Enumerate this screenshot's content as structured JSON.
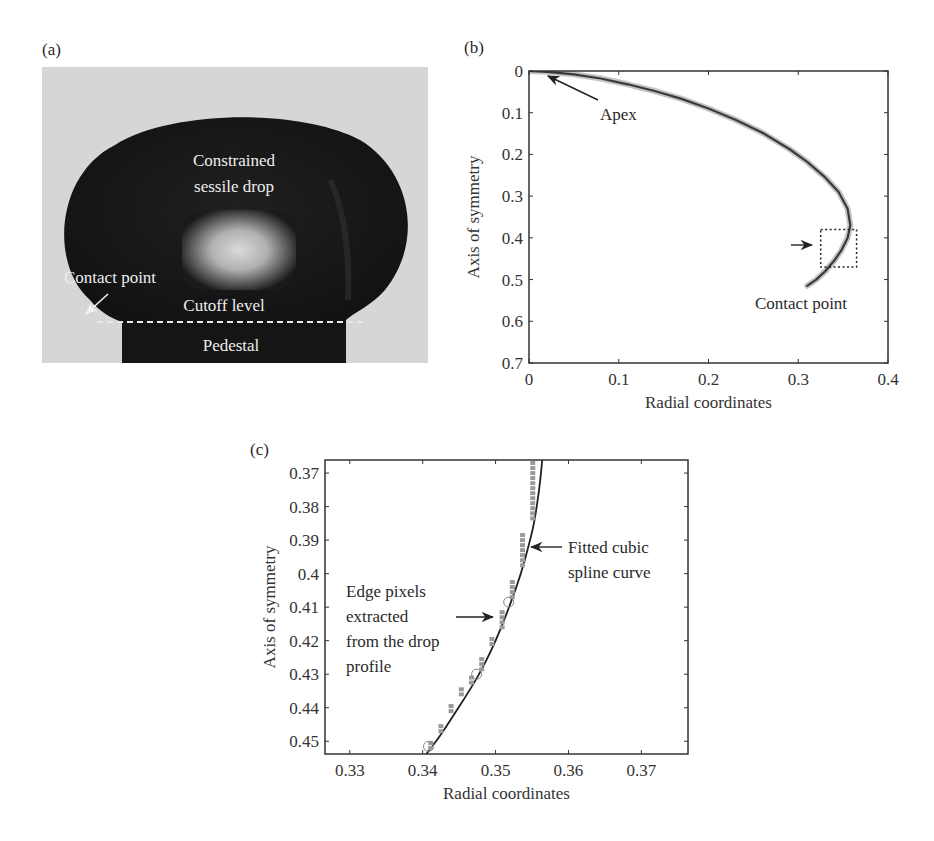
{
  "panels": {
    "a": {
      "label": "(a)",
      "labels": {
        "drop_line1": "Constrained",
        "drop_line2": "sessile drop",
        "contact_point": "Contact point",
        "cutoff_level": "Cutoff level",
        "pedestal": "Pedestal"
      }
    },
    "b": {
      "label": "(b)",
      "annotations": {
        "apex": "Apex",
        "contact_point": "Contact point"
      }
    },
    "c": {
      "label": "(c)",
      "annotations": {
        "spline_line1": "Fitted cubic",
        "spline_line2": "spline curve",
        "edge_line1": "Edge pixels",
        "edge_line2": "extracted",
        "edge_line3": "from the drop",
        "edge_line4": "profile"
      }
    }
  },
  "chart_data": [
    {
      "id": "b",
      "type": "line",
      "title": "",
      "xlabel": "Radial coordinates",
      "ylabel": "Axis of symmetry",
      "xlim": [
        0,
        0.4
      ],
      "ylim": [
        0,
        0.7
      ],
      "y_inverted": true,
      "xticks": [
        "0",
        "0.1",
        "0.2",
        "0.3",
        "0.4"
      ],
      "xtick_values": [
        0,
        0.1,
        0.2,
        0.3,
        0.4
      ],
      "yticks": [
        "0",
        "0.1",
        "0.2",
        "0.3",
        "0.4",
        "0.5",
        "0.6",
        "0.7"
      ],
      "ytick_values": [
        0,
        0.1,
        0.2,
        0.3,
        0.4,
        0.5,
        0.6,
        0.7
      ],
      "grid": false,
      "series": [
        {
          "name": "Drop profile (edge pixels + fitted spline)",
          "x": [
            0,
            0.02,
            0.05,
            0.08,
            0.11,
            0.14,
            0.17,
            0.2,
            0.23,
            0.26,
            0.29,
            0.31,
            0.33,
            0.345,
            0.355,
            0.358,
            0.355,
            0.348,
            0.34,
            0.33,
            0.32,
            0.31
          ],
          "y": [
            0,
            0.002,
            0.008,
            0.018,
            0.032,
            0.048,
            0.067,
            0.09,
            0.117,
            0.148,
            0.187,
            0.218,
            0.255,
            0.29,
            0.33,
            0.37,
            0.4,
            0.43,
            0.455,
            0.48,
            0.5,
            0.515
          ]
        }
      ],
      "annotations": [
        {
          "text": "Apex",
          "points_to": [
            0.015,
            0.005
          ]
        },
        {
          "text": "Contact point",
          "points_to": [
            0.31,
            0.515
          ]
        }
      ],
      "zoom_box": {
        "x": [
          0.325,
          0.365
        ],
        "y": [
          0.38,
          0.47
        ]
      }
    },
    {
      "id": "c",
      "type": "scatter",
      "title": "",
      "xlabel": "Radial coordinates",
      "ylabel": "Axis of symmetry",
      "xlim": [
        0.3266,
        0.3764
      ],
      "ylim": [
        0.3661,
        0.4538
      ],
      "y_inverted": true,
      "xticks": [
        "0.33",
        "0.34",
        "0.35",
        "0.36",
        "0.37"
      ],
      "xtick_values": [
        0.33,
        0.34,
        0.35,
        0.36,
        0.37
      ],
      "yticks": [
        "0.37",
        "0.38",
        "0.39",
        "0.4",
        "0.41",
        "0.42",
        "0.43",
        "0.44",
        "0.45"
      ],
      "ytick_values": [
        0.37,
        0.38,
        0.39,
        0.4,
        0.41,
        0.42,
        0.43,
        0.44,
        0.45
      ],
      "grid": false,
      "series": [
        {
          "name": "Fitted cubic spline curve",
          "kind": "line",
          "x": [
            0.3564,
            0.356,
            0.3553,
            0.3545,
            0.3535,
            0.3522,
            0.3508,
            0.3492,
            0.3475,
            0.3458,
            0.344,
            0.3422,
            0.3405
          ],
          "y": [
            0.3661,
            0.375,
            0.385,
            0.392,
            0.4,
            0.408,
            0.416,
            0.424,
            0.431,
            0.437,
            0.443,
            0.449,
            0.4538
          ]
        },
        {
          "name": "Edge pixels extracted from the drop profile",
          "kind": "markers",
          "x": [
            0.3551,
            0.3551,
            0.3551,
            0.3551,
            0.3551,
            0.3551,
            0.3551,
            0.3551,
            0.3551,
            0.3551,
            0.3551,
            0.3551,
            0.3537,
            0.3537,
            0.3537,
            0.3537,
            0.3537,
            0.3537,
            0.3537,
            0.3523,
            0.3523,
            0.3523,
            0.3523,
            0.3509,
            0.3509,
            0.3509,
            0.3509,
            0.3495,
            0.3495,
            0.3481,
            0.3481,
            0.3481,
            0.3467,
            0.3467,
            0.3453,
            0.3453,
            0.3439,
            0.3439,
            0.3425,
            0.3425,
            0.3411,
            0.3411
          ],
          "y": [
            0.367,
            0.3685,
            0.37,
            0.3715,
            0.373,
            0.3745,
            0.376,
            0.3775,
            0.379,
            0.3805,
            0.382,
            0.3835,
            0.3885,
            0.39,
            0.3915,
            0.393,
            0.3945,
            0.396,
            0.3975,
            0.4025,
            0.404,
            0.4055,
            0.407,
            0.4115,
            0.413,
            0.4145,
            0.416,
            0.4195,
            0.421,
            0.4255,
            0.427,
            0.4285,
            0.431,
            0.4325,
            0.4345,
            0.436,
            0.4395,
            0.441,
            0.4455,
            0.447,
            0.4505,
            0.452
          ]
        },
        {
          "name": "Highlighted edge pixels",
          "kind": "circles",
          "x": [
            0.3518,
            0.3474,
            0.3408
          ],
          "y": [
            0.4085,
            0.43,
            0.4515
          ]
        }
      ],
      "annotations": [
        {
          "text": "Fitted cubic spline curve",
          "points_to": [
            0.3545,
            0.3915
          ]
        },
        {
          "text": "Edge pixels extracted from the drop profile",
          "points_to": [
            0.3505,
            0.4125
          ]
        }
      ]
    }
  ]
}
